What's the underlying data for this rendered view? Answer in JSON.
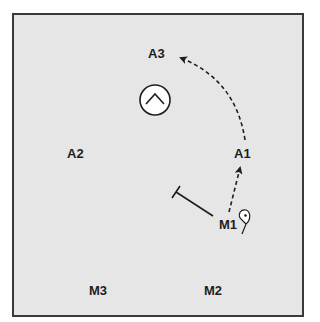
{
  "diagram": {
    "type": "play-diagram",
    "background_color": "#e6e6e6",
    "border_color": "#3a3a3a",
    "ink_color": "#1e1e1e",
    "players": [
      {
        "id": "A3",
        "label": "A3",
        "x": 148,
        "y": 47
      },
      {
        "id": "A2",
        "label": "A2",
        "x": 67,
        "y": 147
      },
      {
        "id": "A1",
        "label": "A1",
        "x": 234,
        "y": 147
      },
      {
        "id": "M1",
        "label": "M1",
        "x": 219,
        "y": 218
      },
      {
        "id": "M3",
        "label": "M3",
        "x": 89,
        "y": 284
      },
      {
        "id": "M2",
        "label": "M2",
        "x": 204,
        "y": 284
      }
    ],
    "goal": {
      "icon": "chevron-up-in-circle",
      "cx": 155,
      "cy": 100,
      "r": 15
    },
    "screen": {
      "from": "M1",
      "icon": "t-bar-screen"
    },
    "movements": [
      {
        "from": "M1",
        "to": "A1",
        "style": "dashed-arrow"
      },
      {
        "from": "A1",
        "to": "A3",
        "style": "dashed-curved-arrow"
      }
    ],
    "ball_marker": {
      "near": "M1",
      "icon": "ball-pin-icon"
    }
  }
}
